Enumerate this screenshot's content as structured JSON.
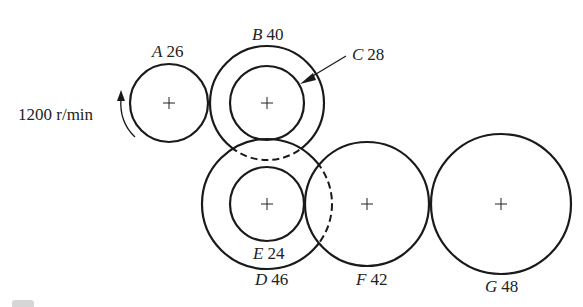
{
  "diagram": {
    "type": "gear-train",
    "input_speed": {
      "label": "1200 r/min",
      "direction_icon": "counterclockwise-arrow"
    },
    "gears": [
      {
        "id": "A",
        "letter": "A",
        "teeth": "26",
        "cx": 169,
        "cy": 103,
        "r": 39
      },
      {
        "id": "B",
        "letter": "B",
        "teeth": "40",
        "cx": 267,
        "cy": 103,
        "r": 57
      },
      {
        "id": "C",
        "letter": "C",
        "teeth": "28",
        "cx": 267,
        "cy": 103,
        "r": 37
      },
      {
        "id": "D",
        "letter": "D",
        "teeth": "46",
        "cx": 267,
        "cy": 204,
        "r": 65
      },
      {
        "id": "E",
        "letter": "E",
        "teeth": "24",
        "cx": 267,
        "cy": 204,
        "r": 37
      },
      {
        "id": "F",
        "letter": "F",
        "teeth": "42",
        "cx": 367,
        "cy": 204,
        "r": 62
      },
      {
        "id": "G",
        "letter": "G",
        "teeth": "48",
        "cx": 501,
        "cy": 204,
        "r": 70
      }
    ],
    "labels": {
      "A": {
        "letter": "A",
        "teeth": "26"
      },
      "B": {
        "letter": "B",
        "teeth": "40"
      },
      "C": {
        "letter": "C",
        "teeth": "28"
      },
      "D": {
        "letter": "D",
        "teeth": "46"
      },
      "E": {
        "letter": "E",
        "teeth": "24"
      },
      "F": {
        "letter": "F",
        "teeth": "42"
      },
      "G": {
        "letter": "G",
        "teeth": "48"
      }
    },
    "colors": {
      "stroke": "#1a1a1a",
      "background": "#ffffff"
    }
  }
}
